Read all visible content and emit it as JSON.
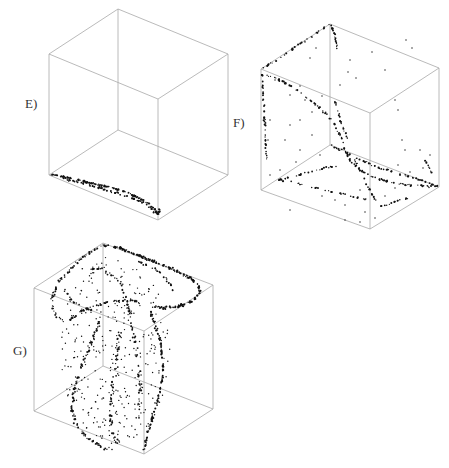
{
  "figure": {
    "panels": [
      {
        "id": "E",
        "label": "E)",
        "label_pos": [
          25,
          96
        ],
        "cube": {
          "top_back": [
            118,
            9
          ],
          "top_left": [
            49,
            54
          ],
          "top_right": [
            228,
            54
          ],
          "top_front": [
            158,
            99
          ],
          "bottom_back": [
            118,
            130
          ],
          "bottom_left": [
            49,
            175
          ],
          "bottom_right": [
            228,
            175
          ],
          "bottom_front": [
            158,
            220
          ]
        },
        "attractor": "flat curve along the bottom-front-left edge of the cube",
        "curves": [
          {
            "points": [
              [
                50,
                174
              ],
              [
                60,
                176
              ],
              [
                75,
                179
              ],
              [
                90,
                183
              ],
              [
                105,
                186
              ],
              [
                120,
                190
              ],
              [
                135,
                196
              ],
              [
                148,
                203
              ],
              [
                155,
                210
              ],
              [
                158,
                214
              ],
              [
                159,
                212
              ],
              [
                160,
                208
              ]
            ],
            "density": 3,
            "jitter": 1.2
          },
          {
            "points": [
              [
                62,
                178
              ],
              [
                80,
                183
              ],
              [
                100,
                188
              ],
              [
                125,
                195
              ],
              [
                145,
                203
              ],
              [
                156,
                213
              ]
            ],
            "density": 2,
            "jitter": 1.5
          }
        ],
        "scatter": []
      },
      {
        "id": "F",
        "label": "F)",
        "label_pos": [
          233,
          115
        ],
        "cube": {
          "top_back": [
            330,
            24
          ],
          "top_left": [
            261,
            69
          ],
          "top_right": [
            439,
            68
          ],
          "top_front": [
            370,
            113
          ],
          "bottom_back": [
            330,
            145
          ],
          "bottom_left": [
            261,
            190
          ],
          "bottom_right": [
            439,
            187
          ],
          "bottom_front": [
            370,
            229
          ]
        },
        "attractor": "sparse scattered dots with filaments along cube edges and diagonals",
        "curves": [
          {
            "points": [
              [
                262,
                69
              ],
              [
                280,
                58
              ],
              [
                300,
                44
              ],
              [
                318,
                32
              ],
              [
                330,
                24
              ]
            ],
            "density": 1.2,
            "jitter": 1.5
          },
          {
            "points": [
              [
                330,
                24
              ],
              [
                334,
                32
              ],
              [
                336,
                42
              ],
              [
                337,
                50
              ]
            ],
            "density": 2,
            "jitter": 0.8
          },
          {
            "points": [
              [
                262,
                72
              ],
              [
                263,
                90
              ],
              [
                264,
                110
              ],
              [
                265,
                130
              ],
              [
                266,
                150
              ],
              [
                267,
                160
              ]
            ],
            "density": 1.4,
            "jitter": 1.2
          },
          {
            "points": [
              [
                264,
                74
              ],
              [
                280,
                80
              ],
              [
                300,
                92
              ],
              [
                318,
                106
              ],
              [
                332,
                120
              ],
              [
                340,
                135
              ],
              [
                345,
                150
              ],
              [
                350,
                160
              ],
              [
                360,
                170
              ],
              [
                375,
                178
              ],
              [
                400,
                184
              ],
              [
                420,
                186
              ],
              [
                438,
                187
              ]
            ],
            "density": 1.6,
            "jitter": 1.6
          },
          {
            "points": [
              [
                330,
                145
              ],
              [
                345,
                152
              ],
              [
                360,
                160
              ],
              [
                380,
                168
              ],
              [
                400,
                174
              ],
              [
                420,
                180
              ],
              [
                438,
                186
              ]
            ],
            "density": 1.4,
            "jitter": 1.5
          },
          {
            "points": [
              [
                278,
                180
              ],
              [
                295,
                176
              ],
              [
                310,
                172
              ],
              [
                325,
                168
              ],
              [
                340,
                166
              ]
            ],
            "density": 1.2,
            "jitter": 1.2
          },
          {
            "points": [
              [
                278,
                180
              ],
              [
                300,
                184
              ],
              [
                325,
                190
              ],
              [
                350,
                196
              ],
              [
                370,
                200
              ]
            ],
            "density": 1,
            "jitter": 1.6
          },
          {
            "points": [
              [
                355,
                160
              ],
              [
                362,
                175
              ],
              [
                370,
                190
              ],
              [
                376,
                200
              ]
            ],
            "density": 1.2,
            "jitter": 1.2
          },
          {
            "points": [
              [
                380,
                207
              ],
              [
                390,
                204
              ],
              [
                400,
                200
              ],
              [
                408,
                198
              ]
            ],
            "density": 1.5,
            "jitter": 1.2
          },
          {
            "points": [
              [
                335,
                102
              ],
              [
                338,
                110
              ],
              [
                340,
                118
              ],
              [
                343,
                128
              ],
              [
                348,
                140
              ]
            ],
            "density": 1.4,
            "jitter": 1.5
          },
          {
            "points": [
              [
                425,
                160
              ],
              [
                428,
                165
              ],
              [
                430,
                170
              ],
              [
                432,
                173
              ]
            ],
            "density": 1.5,
            "jitter": 1
          }
        ],
        "scatter": [
          [
            275,
            80
          ],
          [
            290,
            95
          ],
          [
            300,
            86
          ],
          [
            305,
            100
          ],
          [
            312,
            112
          ],
          [
            322,
            96
          ],
          [
            348,
            72
          ],
          [
            356,
            78
          ],
          [
            372,
            52
          ],
          [
            385,
            70
          ],
          [
            406,
            40
          ],
          [
            412,
            48
          ],
          [
            395,
            100
          ],
          [
            398,
            110
          ],
          [
            402,
            140
          ],
          [
            405,
            150
          ],
          [
            398,
            165
          ],
          [
            410,
            172
          ],
          [
            420,
            150
          ],
          [
            423,
            168
          ],
          [
            430,
            155
          ],
          [
            285,
            140
          ],
          [
            300,
            150
          ],
          [
            296,
            162
          ],
          [
            280,
            170
          ],
          [
            270,
            175
          ],
          [
            318,
            188
          ],
          [
            322,
            196
          ],
          [
            335,
            200
          ],
          [
            345,
            205
          ],
          [
            360,
            190
          ],
          [
            365,
            212
          ],
          [
            385,
            196
          ],
          [
            395,
            188
          ],
          [
            300,
            120
          ],
          [
            290,
            125
          ],
          [
            312,
            135
          ],
          [
            320,
            155
          ],
          [
            340,
            85
          ],
          [
            350,
            60
          ],
          [
            316,
            48
          ],
          [
            310,
            58
          ],
          [
            305,
            42
          ],
          [
            270,
            120
          ],
          [
            268,
            140
          ],
          [
            290,
            210
          ],
          [
            345,
            220
          ],
          [
            360,
            222
          ],
          [
            375,
            218
          ]
        ]
      },
      {
        "id": "G",
        "label": "G)",
        "label_pos": [
          13,
          343
        ],
        "cube": {
          "top_back": [
            103,
            243
          ],
          "top_left": [
            34,
            288
          ],
          "top_right": [
            213,
            285
          ],
          "top_front": [
            144,
            331
          ],
          "bottom_back": [
            103,
            366
          ],
          "bottom_left": [
            34,
            411
          ],
          "bottom_right": [
            213,
            409
          ],
          "bottom_front": [
            144,
            454
          ]
        },
        "attractor": "dense twisted ribbon-shaped attractor filling the cube",
        "curves": [
          {
            "points": [
              [
                103,
                245
              ],
              [
                120,
                248
              ],
              [
                140,
                256
              ],
              [
                160,
                264
              ],
              [
                178,
                272
              ],
              [
                190,
                278
              ],
              [
                198,
                284
              ],
              [
                200,
                292
              ],
              [
                194,
                300
              ],
              [
                180,
                306
              ],
              [
                165,
                308
              ],
              [
                152,
                306
              ]
            ],
            "density": 3.5,
            "jitter": 1.8
          },
          {
            "points": [
              [
                100,
                246
              ],
              [
                90,
                252
              ],
              [
                80,
                260
              ],
              [
                70,
                270
              ],
              [
                60,
                280
              ],
              [
                54,
                292
              ],
              [
                52,
                305
              ],
              [
                56,
                315
              ],
              [
                62,
                320
              ]
            ],
            "density": 2,
            "jitter": 2
          },
          {
            "points": [
              [
                70,
                320
              ],
              [
                80,
                312
              ],
              [
                95,
                306
              ],
              [
                110,
                302
              ],
              [
                125,
                300
              ],
              [
                140,
                302
              ]
            ],
            "density": 2,
            "jitter": 1.6
          },
          {
            "points": [
              [
                82,
                270
              ],
              [
                95,
                268
              ],
              [
                108,
                272
              ],
              [
                118,
                280
              ],
              [
                125,
                292
              ],
              [
                128,
                305
              ],
              [
                130,
                320
              ]
            ],
            "density": 1.5,
            "jitter": 2.5
          },
          {
            "points": [
              [
                135,
                260
              ],
              [
                150,
                266
              ],
              [
                162,
                274
              ],
              [
                170,
                284
              ],
              [
                172,
                292
              ]
            ],
            "density": 1.5,
            "jitter": 2
          },
          {
            "points": [
              [
                150,
                310
              ],
              [
                155,
                325
              ],
              [
                160,
                340
              ],
              [
                163,
                360
              ],
              [
                162,
                380
              ],
              [
                158,
                400
              ],
              [
                152,
                420
              ],
              [
                146,
                440
              ],
              [
                144,
                450
              ]
            ],
            "density": 2.6,
            "jitter": 1.6
          },
          {
            "points": [
              [
                100,
                320
              ],
              [
                94,
                335
              ],
              [
                88,
                352
              ],
              [
                80,
                370
              ],
              [
                74,
                390
              ],
              [
                72,
                410
              ],
              [
                78,
                428
              ],
              [
                90,
                440
              ],
              [
                104,
                448
              ],
              [
                112,
                450
              ]
            ],
            "density": 2,
            "jitter": 2.5
          },
          {
            "points": [
              [
                120,
                330
              ],
              [
                118,
                350
              ],
              [
                115,
                370
              ],
              [
                112,
                390
              ],
              [
                110,
                410
              ],
              [
                112,
                430
              ],
              [
                118,
                445
              ]
            ],
            "density": 1.5,
            "jitter": 3
          },
          {
            "points": [
              [
                130,
                320
              ],
              [
                135,
                340
              ],
              [
                138,
                360
              ],
              [
                140,
                380
              ],
              [
                140,
                400
              ],
              [
                138,
                420
              ]
            ],
            "density": 1.3,
            "jitter": 3
          },
          {
            "points": [
              [
                64,
                290
              ],
              [
                70,
                300
              ],
              [
                80,
                306
              ],
              [
                92,
                310
              ]
            ],
            "density": 1.5,
            "jitter": 2
          }
        ],
        "scatter_region": {
          "cx": 115,
          "cy": 350,
          "rx": 55,
          "ry": 95,
          "count": 320
        }
      }
    ]
  }
}
